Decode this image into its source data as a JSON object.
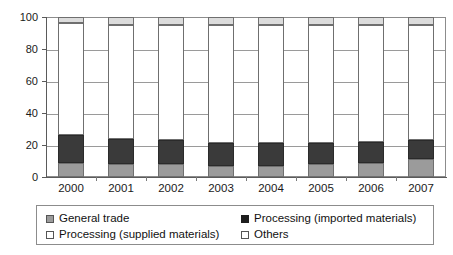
{
  "chart_data": {
    "type": "bar",
    "subtype": "100% stacked column",
    "title": "",
    "xlabel": "",
    "ylabel": "",
    "ylim": [
      0,
      100
    ],
    "yticks": [
      0,
      20,
      40,
      60,
      80,
      100
    ],
    "grid": true,
    "legend_position": "bottom",
    "categories": [
      "2000",
      "2001",
      "2002",
      "2003",
      "2004",
      "2005",
      "2006",
      "2007"
    ],
    "series": [
      {
        "name": "General trade",
        "color": "#9b9b9b",
        "values": [
          9,
          8,
          8,
          7,
          7,
          8,
          9,
          11
        ]
      },
      {
        "name": "Processing (imported materials)",
        "color": "#3a3a3a",
        "values": [
          17,
          16,
          15,
          14,
          14,
          13,
          13,
          12
        ]
      },
      {
        "name": "Processing (supplied materials)",
        "color": "#ffffff",
        "values": [
          70,
          71,
          72,
          74,
          74,
          74,
          73,
          72
        ]
      },
      {
        "name": "Others",
        "color": "#dcdcdc",
        "values": [
          4,
          5,
          5,
          5,
          5,
          5,
          5,
          5
        ]
      }
    ]
  },
  "axis": {
    "y_labels": [
      "100",
      "80",
      "60",
      "40",
      "20",
      "0"
    ],
    "x_labels": [
      "2000",
      "2001",
      "2002",
      "2003",
      "2004",
      "2005",
      "2006",
      "2007"
    ]
  },
  "legend": {
    "items": [
      {
        "label": "General trade",
        "swatch": "general-trade-swatch"
      },
      {
        "label": "Processing (imported materials)",
        "swatch": "processing-imported-swatch"
      },
      {
        "label": "Processing (supplied materials)",
        "swatch": "processing-supplied-swatch"
      },
      {
        "label": "Others",
        "swatch": "others-swatch"
      }
    ]
  },
  "colors": {
    "general_trade": "#9b9b9b",
    "processing_imported": "#3a3a3a",
    "processing_supplied": "#ffffff",
    "others": "#dcdcdc",
    "grid": "#9a9a9a",
    "axis": "#5a5a5a",
    "text": "#1a1a1a"
  }
}
